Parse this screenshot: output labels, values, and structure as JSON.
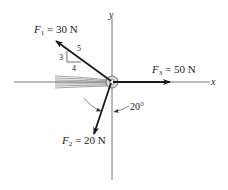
{
  "diagram": {
    "type": "force-diagram",
    "axes": {
      "x_label": "x",
      "y_label": "y"
    },
    "forces": [
      {
        "id": "F1",
        "symbol": "F",
        "subscript": "1",
        "equals": " = ",
        "magnitude": "30 N",
        "direction": "slope 3-4-5, up and to the left"
      },
      {
        "id": "F2",
        "symbol": "F",
        "subscript": "2",
        "equals": " = ",
        "magnitude": "20 N",
        "direction": "20° from negative y-axis, toward negative x"
      },
      {
        "id": "F3",
        "symbol": "F",
        "subscript": "3",
        "equals": " = ",
        "magnitude": "50 N",
        "direction": "along positive x-axis"
      }
    ],
    "slope_triangle": {
      "rise": "3",
      "run": "4",
      "hypotenuse": "5"
    },
    "angle_label": "20°",
    "colors": {
      "arrow": "#1a1a1a",
      "axis": "#555555",
      "cable": "#8a8a8a",
      "text": "#222222"
    }
  }
}
